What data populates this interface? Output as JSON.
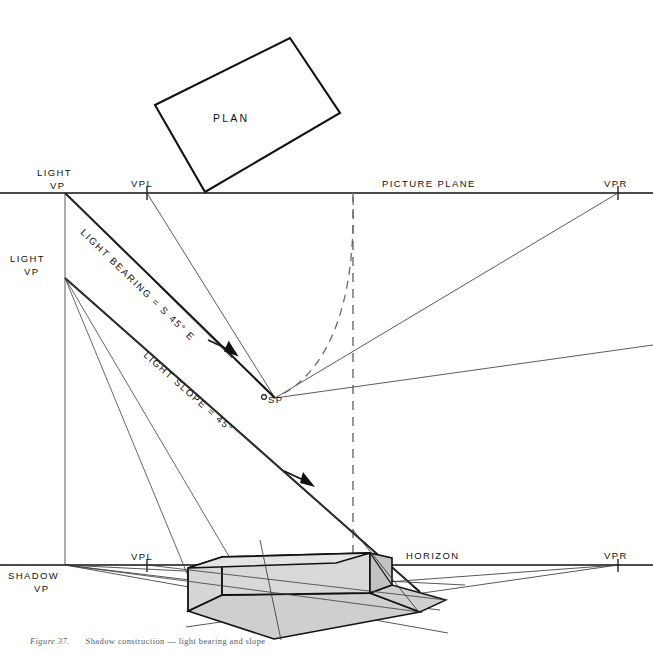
{
  "figure": {
    "title_plan": "PLAN",
    "caption_label": "Figure 37.",
    "caption_text": "Shadow construction — light bearing and slope"
  },
  "labels": {
    "light_vp_upper": {
      "line1": "LIGHT",
      "line2": "VP"
    },
    "light_vp_lower": {
      "line1": "LIGHT",
      "line2": "VP"
    },
    "shadow_vp": {
      "line1": "SHADOW",
      "line2": "VP"
    },
    "vpl_top": "VPL",
    "vpr_top": "VPR",
    "vpl_bottom": "VPL",
    "vpr_bottom": "VPR",
    "picture_plane": "PICTURE  PLANE",
    "horizon": "HORIZON",
    "station_point": "SP",
    "light_bearing": "LIGHT BEARING = S 45° E",
    "light_slope": "LIGHT SLOPE = 45°"
  },
  "geometry": {
    "picture_plane_y": 193,
    "horizon_y": 565,
    "light_vp_upper_x": 65,
    "light_vp_upper_y": 193,
    "light_vp_lower_x": 65,
    "light_vp_lower_y": 278,
    "shadow_vp_x": 65,
    "shadow_vp_y": 565,
    "vpl_top_x": 147,
    "vpr_top_x": 618,
    "vpl_bottom_x": 147,
    "vpr_bottom_x": 618,
    "sp_x": 275,
    "sp_y": 398,
    "plan_corners": "155,105 290,38 340,113 205,192"
  },
  "colors": {
    "ink": "#111111",
    "thin_line": "#4a4a4a",
    "box_face_light": "#d6d6d6",
    "box_face_dark": "#c2c2c2",
    "shadow_fill": "#cfcfcf",
    "paper": "#ffffff",
    "caption": "#555a60"
  }
}
